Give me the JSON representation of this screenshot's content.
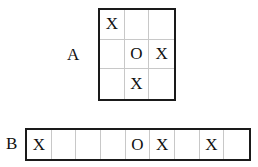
{
  "grid_a": {
    "label": "A",
    "rows": 3,
    "cols": 3,
    "cells": [
      "X",
      "",
      "",
      "",
      "O",
      "X",
      "",
      "X",
      ""
    ]
  },
  "strip_b": {
    "label": "B",
    "cells": [
      "X",
      "",
      "",
      "",
      "O",
      "X",
      "",
      "X",
      ""
    ]
  }
}
